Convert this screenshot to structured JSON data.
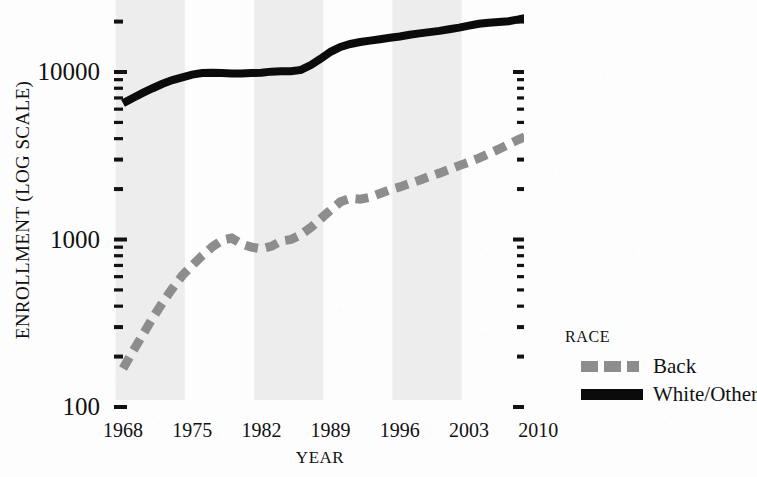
{
  "chart_data": {
    "type": "line",
    "title": "",
    "xlabel": "YEAR",
    "ylabel": "ENROLLMENT (LOG SCALE)",
    "y_scale": "log",
    "ylim": [
      100,
      30000
    ],
    "xlim": [
      1968,
      2010
    ],
    "grid": false,
    "y_tick_labels": [
      "10000",
      "1000",
      "100"
    ],
    "y_tick_values": [
      10000,
      1000,
      100
    ],
    "x_tick_labels": [
      "1968",
      "1975",
      "1982",
      "1989",
      "1996",
      "2003",
      "2010"
    ],
    "x_tick_values": [
      1968,
      1975,
      1982,
      1989,
      1996,
      2003,
      2010
    ],
    "legend_title": "RACE",
    "legend_position": "right",
    "banding": {
      "note": "alternating light-gray vertical bands every 7 years",
      "color": "#ededed",
      "spans": [
        [
          1968,
          1975
        ],
        [
          1982,
          1989
        ],
        [
          1996,
          2003
        ],
        [
          2010,
          2012
        ]
      ]
    },
    "x": [
      1968,
      1969,
      1970,
      1971,
      1972,
      1973,
      1974,
      1975,
      1976,
      1977,
      1978,
      1979,
      1980,
      1981,
      1982,
      1983,
      1984,
      1985,
      1986,
      1987,
      1988,
      1989,
      1990,
      1991,
      1992,
      1993,
      1994,
      1995,
      1996,
      1997,
      1998,
      1999,
      2000,
      2001,
      2002,
      2003,
      2004,
      2005,
      2006,
      2007,
      2008,
      2009,
      2010
    ],
    "series": [
      {
        "name": "Back",
        "color": "#8d8d8d",
        "style": "dashed",
        "values": [
          170,
          215,
          270,
          340,
          420,
          510,
          610,
          700,
          800,
          900,
          990,
          1020,
          940,
          900,
          880,
          910,
          980,
          1000,
          1070,
          1180,
          1330,
          1500,
          1680,
          1760,
          1740,
          1790,
          1880,
          1980,
          2060,
          2160,
          2260,
          2380,
          2490,
          2620,
          2760,
          2900,
          3060,
          3250,
          3460,
          3700,
          3950,
          4200,
          4400
        ]
      },
      {
        "name": "White/Other",
        "color": "#0b0b0b",
        "style": "solid",
        "values": [
          6500,
          7000,
          7500,
          8000,
          8500,
          8950,
          9300,
          9650,
          9850,
          9900,
          9850,
          9800,
          9800,
          9850,
          9900,
          10050,
          10100,
          10100,
          10300,
          11000,
          12000,
          13200,
          14100,
          14700,
          15100,
          15400,
          15700,
          16000,
          16300,
          16700,
          17000,
          17300,
          17600,
          18000,
          18400,
          18900,
          19400,
          19700,
          19900,
          20100,
          20600,
          21200,
          21400
        ]
      }
    ]
  },
  "legend": {
    "title": "RACE",
    "entries": [
      {
        "label": "Back",
        "color": "#8d8d8d",
        "style": "dashed"
      },
      {
        "label": "White/Other",
        "color": "#0b0b0b",
        "style": "solid"
      }
    ]
  },
  "axes": {
    "y_title": "ENROLLMENT (LOG SCALE)",
    "x_title": "YEAR"
  }
}
